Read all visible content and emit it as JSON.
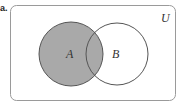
{
  "part_label": "a.",
  "diagram": {
    "type": "venn",
    "universe_label": "U",
    "sets": [
      {
        "name": "A",
        "shaded": true
      },
      {
        "name": "B",
        "shaded": false
      }
    ],
    "shaded_region": "A",
    "colors": {
      "shade": "#a9a9a9",
      "stroke": "#555555",
      "frame": "#9a9a9a"
    }
  }
}
